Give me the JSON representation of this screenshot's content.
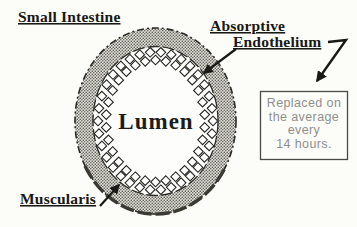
{
  "diagram": {
    "title": "Small Intestine",
    "labels": {
      "small_intestine": "Small Intestine",
      "absorptive": "Absorptive",
      "endothelium": "Endothelium",
      "lumen": "Lumen",
      "muscularis": "Muscularis"
    },
    "note": {
      "line1": "Replaced on",
      "line2": "the average",
      "line3": "every",
      "line4": "14 hours."
    },
    "colors": {
      "ink": "#191915",
      "muscularis_fill_base": "#e2e1db",
      "muscularis_fill_dot": "#5d5d55",
      "note_text": "#8f8f8c",
      "note_border": "#4a4a45",
      "background": "#fcfcf9"
    }
  }
}
